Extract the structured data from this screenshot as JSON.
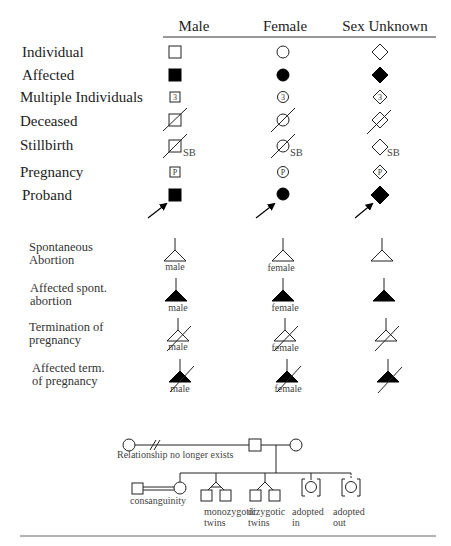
{
  "header": {
    "columns": [
      "Male",
      "Female",
      "Sex Unknown"
    ]
  },
  "rows": [
    {
      "label": "Individual",
      "symbol": "open"
    },
    {
      "label": "Affected",
      "symbol": "filled"
    },
    {
      "label": "Multiple Individuals",
      "symbol": "numbered",
      "inner_text": "3"
    },
    {
      "label": "Deceased",
      "symbol": "slashed"
    },
    {
      "label": "Stillbirth",
      "symbol": "slashed-sb",
      "suffix": "SB"
    },
    {
      "label": "Pregnancy",
      "symbol": "lettered",
      "inner_text": "P"
    },
    {
      "label": "Proband",
      "symbol": "filled-arrow"
    }
  ],
  "abortion_rows": [
    {
      "label_lines": [
        "Spontaneous",
        "Abortion"
      ],
      "symbol": "open-triangle"
    },
    {
      "label_lines": [
        "Affected spont.",
        "abortion"
      ],
      "symbol": "filled-triangle"
    },
    {
      "label_lines": [
        "Termination of",
        "pregnancy"
      ],
      "symbol": "open-triangle-slashed"
    },
    {
      "label_lines": [
        "Affected term.",
        "of pregnancy"
      ],
      "symbol": "filled-triangle-slashed"
    }
  ],
  "abortion_sex_labels": [
    "male",
    "female",
    ""
  ],
  "pedigree": {
    "relationship_label": "Relationship no longer  exists",
    "consanguinity_label": "consanguinity",
    "monozygotic_label": [
      "monozygotic",
      "twins"
    ],
    "dizygotic_label": [
      "dizygotic",
      "twins"
    ],
    "adopted_in_label": [
      "adopted",
      "in"
    ],
    "adopted_out_label": [
      "adopted",
      "out"
    ]
  }
}
